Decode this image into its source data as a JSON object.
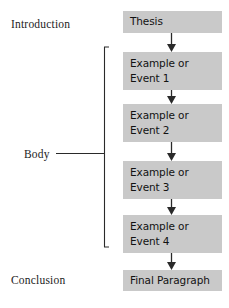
{
  "diagram": {
    "type": "flowchart",
    "orientation": "vertical",
    "colors": {
      "box_fill": "#c9c9c9",
      "text": "#121212",
      "label_text": "#1c1c1c",
      "line": "#2a2a2a",
      "background": "#ffffff"
    }
  },
  "sections": [
    {
      "key": "introduction",
      "label": "Introduction"
    },
    {
      "key": "body",
      "label": "Body"
    },
    {
      "key": "conclusion",
      "label": "Conclusion"
    }
  ],
  "flow": {
    "nodes": [
      {
        "key": "thesis",
        "lines": [
          "Thesis"
        ],
        "section": "introduction"
      },
      {
        "key": "example_1",
        "lines": [
          "Example or",
          "Event 1"
        ],
        "section": "body"
      },
      {
        "key": "example_2",
        "lines": [
          "Example or",
          "Event 2"
        ],
        "section": "body"
      },
      {
        "key": "example_3",
        "lines": [
          "Example or",
          "Event 3"
        ],
        "section": "body"
      },
      {
        "key": "example_4",
        "lines": [
          "Example or",
          "Event 4"
        ],
        "section": "body"
      },
      {
        "key": "final",
        "lines": [
          "Final Paragraph"
        ],
        "section": "conclusion"
      }
    ],
    "arrows": [
      {
        "from": "thesis",
        "to": "example_1"
      },
      {
        "from": "example_1",
        "to": "example_2"
      },
      {
        "from": "example_2",
        "to": "example_3"
      },
      {
        "from": "example_3",
        "to": "example_4"
      },
      {
        "from": "example_4",
        "to": "final"
      }
    ]
  },
  "bracket": {
    "label": "Body",
    "spans": [
      "example_1",
      "example_2",
      "example_3",
      "example_4"
    ]
  }
}
